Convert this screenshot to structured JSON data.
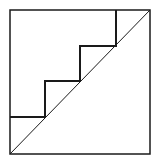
{
  "diagram": {
    "colors": {
      "background": "#ffffff",
      "stroke": "#1a1a1a"
    },
    "square": {
      "x": 10,
      "y": 10,
      "width": 140,
      "height": 144
    },
    "diagonal": {
      "x1": 10,
      "y1": 154,
      "x2": 150,
      "y2": 10
    },
    "staircase_points": "10,117 45,117 45,81 80,81 80,46 116,46 116,10",
    "steps": 4
  }
}
